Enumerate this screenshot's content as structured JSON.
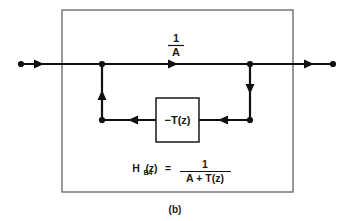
{
  "figure": {
    "caption": "(b)",
    "outer_box": {
      "name": "system-boundary"
    },
    "forward_path": {
      "gain_numerator": "1",
      "gain_denominator": "A",
      "gain_label": "1/A"
    },
    "feedback_block": {
      "label": "−T(z)",
      "name": "minus-T-of-z-block"
    },
    "equation": {
      "lhs_symbol": "H",
      "lhs_subscript": "B4",
      "lhs_arg": "(z)",
      "equals": "=",
      "rhs_numerator": "1",
      "rhs_denominator": "A + T(z)",
      "full_text": "H_B4(z) = 1 / (A + T(z))"
    },
    "colors": {
      "line": "#111111",
      "box_border": "#6d6d6d",
      "block_border": "#1a1a1a",
      "background": "#ffffff",
      "text": "#1a1a1a"
    },
    "nodes": [
      {
        "name": "input-terminal",
        "x": 21,
        "y": 64
      },
      {
        "name": "summing-node-left",
        "x": 102,
        "y": 64
      },
      {
        "name": "pickoff-node-right",
        "x": 250,
        "y": 64
      },
      {
        "name": "output-terminal",
        "x": 333,
        "y": 64
      },
      {
        "name": "feedback-corner-left",
        "x": 102,
        "y": 120
      },
      {
        "name": "feedback-corner-right",
        "x": 250,
        "y": 120
      }
    ],
    "arrows": [
      {
        "name": "input-arrow",
        "direction": "right"
      },
      {
        "name": "forward-gain-arrow",
        "direction": "right"
      },
      {
        "name": "output-arrow",
        "direction": "right"
      },
      {
        "name": "feedback-up-arrow",
        "direction": "up"
      },
      {
        "name": "feedback-down-arrow",
        "direction": "down"
      },
      {
        "name": "feedback-left-arrow-outer",
        "direction": "left"
      },
      {
        "name": "feedback-left-arrow-inner",
        "direction": "left"
      }
    ]
  }
}
